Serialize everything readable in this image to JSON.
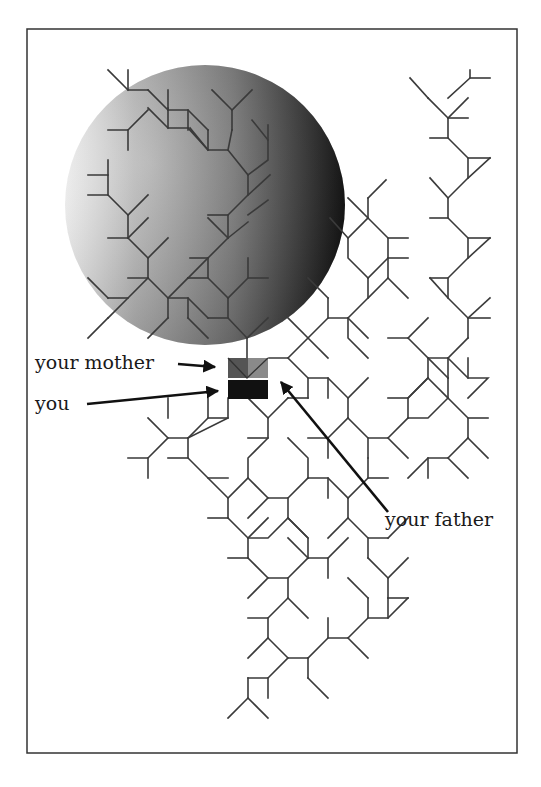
{
  "figure": {
    "type": "ancestry tree illustration",
    "labels": {
      "mother": "your mother",
      "you": "you",
      "father": "your father"
    },
    "colors": {
      "frame": "#333333",
      "branch": "#3a3a3a",
      "arrow": "#111111",
      "you_square": "#111111",
      "mother_square_left": "#555555",
      "mother_square_right": "#8a8a8a",
      "sphere_light": "#ffffff",
      "sphere_mid": "#8c8c8c",
      "sphere_dark": "#141414"
    },
    "frame": {
      "x": 27,
      "y": 29,
      "width": 490,
      "height": 724
    },
    "sphere": {
      "cx": 205,
      "cy": 205,
      "r": 140
    }
  }
}
